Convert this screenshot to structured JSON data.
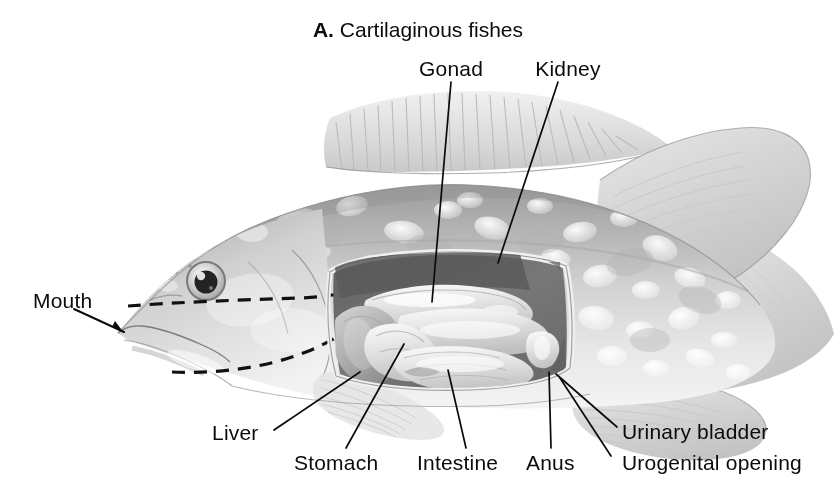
{
  "figure": {
    "title_prefix": "A.",
    "title_text": "Cartilaginous fishes",
    "background_color": "#ffffff",
    "ink_color": "#0b0b0b",
    "body_gray": "#c9c9c9",
    "cavity_dark": "#6e6e6e"
  },
  "labels": {
    "gonad": "Gonad",
    "kidney": "Kidney",
    "mouth": "Mouth",
    "liver": "Liver",
    "stomach": "Stomach",
    "intestine": "Intestine",
    "anus": "Anus",
    "urinary_bladder": "Urinary bladder",
    "urogenital_opening": "Urogenital opening"
  },
  "parts": {
    "dorsal_fin": "dorsal-fin",
    "anal_fin": "anal-fin",
    "pectoral_fin": "pectoral-fin",
    "caudal_region": "caudal-region",
    "eye": "eye",
    "gill_cover": "gill-cover",
    "body_cavity": "body-cavity-cutaway",
    "gonad_organ": "gonad-organ",
    "liver_organ": "liver-organ",
    "stomach_organ": "stomach-organ",
    "intestine_organ": "intestine-organ",
    "urinary_bladder_organ": "urinary-bladder-organ"
  }
}
